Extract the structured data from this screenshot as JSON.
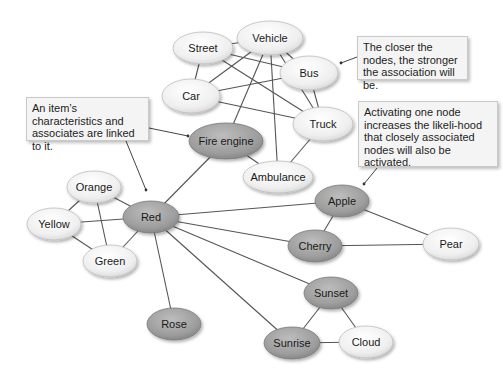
{
  "diagram": {
    "colors": {
      "light_node": "#efefef",
      "dark_node": "#9a9a9a",
      "edge": "#555555",
      "callout_bg": "#f4f4f4"
    },
    "nodes": [
      {
        "id": "street",
        "label": "Street",
        "x": 203,
        "y": 48,
        "rx": 30,
        "ry": 16,
        "shade": "light"
      },
      {
        "id": "vehicle",
        "label": "Vehicle",
        "x": 270,
        "y": 38,
        "rx": 33,
        "ry": 17,
        "shade": "light"
      },
      {
        "id": "bus",
        "label": "Bus",
        "x": 309,
        "y": 73,
        "rx": 29,
        "ry": 17,
        "shade": "light"
      },
      {
        "id": "car",
        "label": "Car",
        "x": 191,
        "y": 96,
        "rx": 29,
        "ry": 17,
        "shade": "light"
      },
      {
        "id": "truck",
        "label": "Truck",
        "x": 323,
        "y": 124,
        "rx": 30,
        "ry": 17,
        "shade": "light"
      },
      {
        "id": "fire_engine",
        "label": "Fire engine",
        "x": 226,
        "y": 141,
        "rx": 37,
        "ry": 18,
        "shade": "dark"
      },
      {
        "id": "ambulance",
        "label": "Ambulance",
        "x": 278,
        "y": 177,
        "rx": 35,
        "ry": 16,
        "shade": "light"
      },
      {
        "id": "orange",
        "label": "Orange",
        "x": 94,
        "y": 187,
        "rx": 27,
        "ry": 16,
        "shade": "light"
      },
      {
        "id": "yellow",
        "label": "Yellow",
        "x": 54,
        "y": 224,
        "rx": 27,
        "ry": 16,
        "shade": "light"
      },
      {
        "id": "red",
        "label": "Red",
        "x": 151,
        "y": 217,
        "rx": 28,
        "ry": 16,
        "shade": "dark"
      },
      {
        "id": "green",
        "label": "Green",
        "x": 110,
        "y": 261,
        "rx": 27,
        "ry": 16,
        "shade": "light"
      },
      {
        "id": "rose",
        "label": "Rose",
        "x": 174,
        "y": 324,
        "rx": 27,
        "ry": 16,
        "shade": "dark"
      },
      {
        "id": "apple",
        "label": "Apple",
        "x": 342,
        "y": 201,
        "rx": 27,
        "ry": 16,
        "shade": "dark"
      },
      {
        "id": "cherry",
        "label": "Cherry",
        "x": 315,
        "y": 246,
        "rx": 27,
        "ry": 16,
        "shade": "dark"
      },
      {
        "id": "pear",
        "label": "Pear",
        "x": 451,
        "y": 244,
        "rx": 28,
        "ry": 16,
        "shade": "light"
      },
      {
        "id": "sunset",
        "label": "Sunset",
        "x": 331,
        "y": 293,
        "rx": 27,
        "ry": 16,
        "shade": "dark"
      },
      {
        "id": "sunrise",
        "label": "Sunrise",
        "x": 292,
        "y": 343,
        "rx": 28,
        "ry": 16,
        "shade": "dark"
      },
      {
        "id": "cloud",
        "label": "Cloud",
        "x": 366,
        "y": 342,
        "rx": 27,
        "ry": 16,
        "shade": "light"
      }
    ],
    "edges": [
      [
        "street",
        "vehicle"
      ],
      [
        "street",
        "car"
      ],
      [
        "street",
        "bus"
      ],
      [
        "street",
        "truck"
      ],
      [
        "vehicle",
        "car"
      ],
      [
        "vehicle",
        "bus"
      ],
      [
        "vehicle",
        "truck"
      ],
      [
        "vehicle",
        "fire_engine"
      ],
      [
        "vehicle",
        "ambulance"
      ],
      [
        "car",
        "bus"
      ],
      [
        "car",
        "truck"
      ],
      [
        "bus",
        "truck"
      ],
      [
        "truck",
        "ambulance"
      ],
      [
        "fire_engine",
        "ambulance"
      ],
      [
        "fire_engine",
        "red"
      ],
      [
        "orange",
        "yellow"
      ],
      [
        "orange",
        "red"
      ],
      [
        "orange",
        "green"
      ],
      [
        "yellow",
        "red"
      ],
      [
        "yellow",
        "green"
      ],
      [
        "green",
        "red"
      ],
      [
        "red",
        "rose"
      ],
      [
        "red",
        "apple"
      ],
      [
        "red",
        "cherry"
      ],
      [
        "red",
        "sunset"
      ],
      [
        "red",
        "sunrise"
      ],
      [
        "apple",
        "cherry"
      ],
      [
        "apple",
        "pear"
      ],
      [
        "cherry",
        "pear"
      ],
      [
        "sunset",
        "sunrise"
      ],
      [
        "sunset",
        "cloud"
      ],
      [
        "sunrise",
        "cloud"
      ]
    ],
    "callouts": [
      {
        "id": "characteristics",
        "text": "An item’s characteristics and associates are linked to it.",
        "box": {
          "x": 26,
          "y": 97,
          "w": 123,
          "h": 44
        },
        "pointers": [
          [
            149,
            128,
            188,
            136
          ],
          [
            126,
            141,
            146,
            190
          ]
        ]
      },
      {
        "id": "closer",
        "text": "The closer the nodes, the stronger the association will be.",
        "box": {
          "x": 357,
          "y": 36,
          "w": 111,
          "h": 44
        },
        "pointers": [
          [
            357,
            57,
            341,
            63
          ]
        ]
      },
      {
        "id": "activating",
        "text": "Activating one node increases the likeli-hood that closely associated nodes will also be activated.",
        "box": {
          "x": 358,
          "y": 101,
          "w": 140,
          "h": 66
        },
        "pointers": [
          [
            377,
            168,
            364,
            184
          ]
        ]
      }
    ]
  }
}
